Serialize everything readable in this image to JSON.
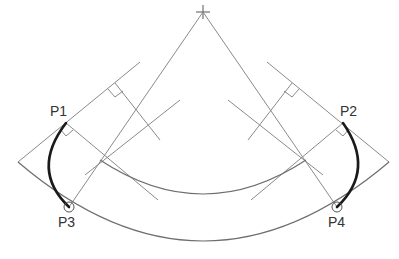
{
  "diagram": {
    "type": "geometric-construction",
    "center_mark": {
      "x": 203,
      "y": 12,
      "symbol": "crosshair"
    },
    "points": [
      {
        "id": "P1",
        "label": "P1",
        "x": 66,
        "y": 123,
        "label_x": 50,
        "label_y": 116
      },
      {
        "id": "P2",
        "label": "P2",
        "x": 343,
        "y": 123,
        "label_x": 340,
        "label_y": 116
      },
      {
        "id": "P3",
        "label": "P3",
        "x": 69,
        "y": 207,
        "label_x": 58,
        "label_y": 227,
        "marker": "circle"
      },
      {
        "id": "P4",
        "label": "P4",
        "x": 337,
        "y": 207,
        "label_x": 328,
        "label_y": 227,
        "marker": "circle"
      }
    ],
    "colors": {
      "construction_line": "#8a8a8a",
      "arc_line": "#6e6e6e",
      "bold_arc": "#1a1a1a",
      "label_text": "#333333",
      "background": "#ffffff"
    }
  }
}
